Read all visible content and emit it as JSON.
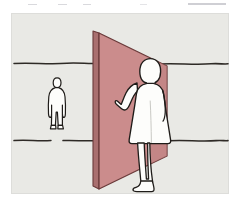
{
  "page": {
    "background_color": "#ffffff",
    "width": 237,
    "height": 204
  },
  "top_strip": {
    "description": "faint grey remnants of cropped text cut off above the figure",
    "marks": 5,
    "color": "#d9d9dd"
  },
  "illustration": {
    "name": "perspective-scale-diagram",
    "caption_visible": false,
    "background_color": "#e9e9e5",
    "border_color": "#dedeDA",
    "elements": {
      "panel": {
        "label": "pink-wall-panel",
        "fill_color": "#cb8c8c",
        "edge_fill_color": "#a76e6e",
        "outline_color": "#6b3b3b",
        "shape": "vertical rectangular plane receding in perspective, tall at left, shorter at right"
      },
      "horizon_line": {
        "label": "upper-horizon-line",
        "color": "#2e2a26",
        "y": 50
      },
      "ground_line": {
        "label": "lower-ground-line",
        "color": "#2e2a26",
        "y": 127
      },
      "small_figure": {
        "label": "distant-standing-person",
        "fill_color": "#fdfdfb",
        "outline_color": "#1f1c19",
        "position": "left background, standing on ground line",
        "scale": "small"
      },
      "large_figure": {
        "label": "foreground-person-touching-panel",
        "fill_color": "#fdfdfb",
        "outline_color": "#1f1c19",
        "position": "right of panel center, foreground",
        "scale": "large",
        "pose": "standing, left arm raised with open hand pressed against the pink panel"
      }
    }
  }
}
